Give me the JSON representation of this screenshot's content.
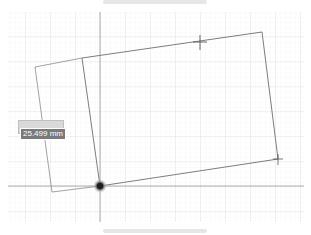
{
  "canvas": {
    "background": "#ffffff",
    "grid_minor_color": "#f0f0f0",
    "grid_major_color": "#e0e0e0",
    "axis_color": "#9a9a9a",
    "sketch_line_color": "#7d7d7d",
    "origin_color": "#333333"
  },
  "dimension_input": {
    "value": "25.499 mm"
  },
  "markers": [
    {
      "name": "midpoint-cross",
      "x": 200,
      "y": 42
    },
    {
      "name": "corner-cross",
      "x": 278,
      "y": 160
    }
  ],
  "origin": {
    "x": 100,
    "y": 186
  }
}
